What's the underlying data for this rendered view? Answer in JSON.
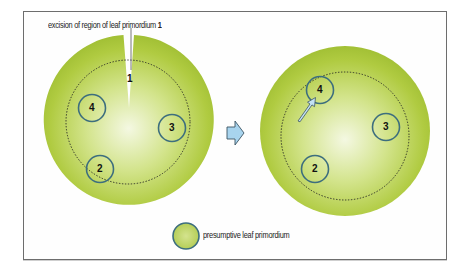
{
  "figure": {
    "annotation": {
      "text": "excision of region of leaf primordium",
      "number": "1"
    },
    "left_meristem": {
      "excision_label": "1",
      "primordia": [
        {
          "label": "4"
        },
        {
          "label": "3"
        },
        {
          "label": "2"
        }
      ]
    },
    "transition_arrow": "arrow-right",
    "right_meristem": {
      "primordia": [
        {
          "label": "4"
        },
        {
          "label": "3"
        },
        {
          "label": "2"
        }
      ]
    },
    "legend": {
      "label": "presumptive leaf primordium"
    },
    "colors": {
      "meristem_green": "#a9c63a",
      "meristem_center": "#f2f7dc",
      "primordium_outline": "#3d6e7e",
      "arrow_fill": "#a8d4ee",
      "frame_border": "#6d6d6d"
    }
  }
}
